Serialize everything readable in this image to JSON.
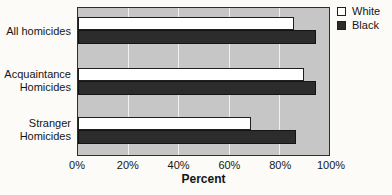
{
  "chart_data": {
    "type": "bar",
    "orientation": "horizontal",
    "title": "",
    "xlabel": "Percent",
    "xlim": [
      0,
      100
    ],
    "x_ticks": [
      "0%",
      "20%",
      "40%",
      "60%",
      "80%",
      "100%"
    ],
    "grid": true,
    "legend_position": "top-right",
    "plot_background": "#c6c6c6",
    "categories": [
      "All homicides",
      "Acquaintance Homicides",
      "Stranger Homicides"
    ],
    "category_label_lines": [
      [
        "All homicides"
      ],
      [
        "Acquaintance",
        "Homicides"
      ],
      [
        "Stranger",
        "Homicides"
      ]
    ],
    "series": [
      {
        "name": "White",
        "color": "#ffffff",
        "values": [
          86,
          90,
          69
        ]
      },
      {
        "name": "Black",
        "color": "#2c2c2c",
        "values": [
          95,
          95,
          87
        ]
      }
    ]
  }
}
